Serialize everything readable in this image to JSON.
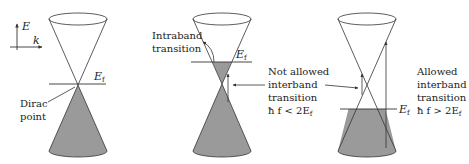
{
  "diagram": {
    "colors": {
      "line": "#333333",
      "fill": "#9a9a9a",
      "background": "#ffffff"
    },
    "axes": {
      "y_label": "E",
      "x_label": "k"
    },
    "panels": [
      {
        "id": "pristine",
        "fermi_label": "E",
        "fermi_sub": "f",
        "annotation_lines": [
          "Dirac",
          "point"
        ]
      },
      {
        "id": "doped-low-frequency",
        "fermi_label": "E",
        "fermi_sub": "f",
        "intraband_lines": [
          "Intraband",
          "transition"
        ],
        "annotation_lines": [
          "Not allowed",
          "interband",
          "transition"
        ],
        "condition_prefix": "ħ f < 2E",
        "condition_sub": "f"
      },
      {
        "id": "doped-high-frequency",
        "fermi_label": "E",
        "fermi_sub": "f",
        "annotation_lines": [
          "Allowed",
          "interband",
          "transition"
        ],
        "condition_prefix": "ħ f > 2E",
        "condition_sub": "f"
      }
    ]
  }
}
